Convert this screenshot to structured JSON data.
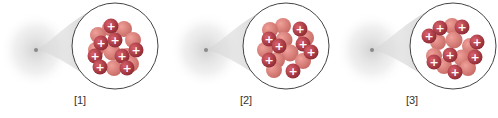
{
  "figure": {
    "colors": {
      "proton": "#c0404a",
      "neutron": "#e0807a",
      "plus_sign": "#ffffff",
      "callout_outline": "#444444",
      "cloud": "#d8d8d8"
    },
    "panels": [
      {
        "label": "[1]",
        "proton_symbol": "+"
      },
      {
        "label": "[2]",
        "proton_symbol": "+"
      },
      {
        "label": "[3]",
        "proton_symbol": "+"
      }
    ]
  }
}
